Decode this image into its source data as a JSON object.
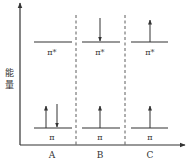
{
  "diagram": {
    "y_axis_label": "能量",
    "columns": [
      {
        "id": "A",
        "label": "A",
        "upper_level_label": "π*",
        "lower_level_label": "π",
        "upper_electrons": [],
        "lower_electrons": [
          "up",
          "down"
        ]
      },
      {
        "id": "B",
        "label": "B",
        "upper_level_label": "π*",
        "lower_level_label": "π",
        "upper_electrons": [
          "down"
        ],
        "lower_electrons": [
          "up"
        ]
      },
      {
        "id": "C",
        "label": "C",
        "upper_level_label": "π*",
        "lower_level_label": "π",
        "upper_electrons": [
          "up"
        ],
        "lower_electrons": [
          "up"
        ]
      }
    ],
    "colors": {
      "line": "#333333",
      "background": "#ffffff"
    }
  }
}
